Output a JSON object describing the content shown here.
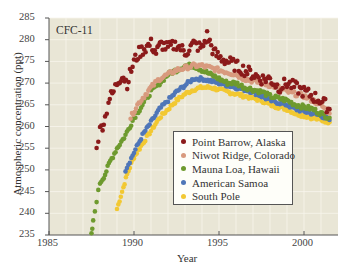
{
  "chart_data": {
    "type": "scatter",
    "title": "CFC-11",
    "xlabel": "Year",
    "ylabel": "Atmospheric concentration (ppt)",
    "xlim": [
      1985,
      2002
    ],
    "ylim": [
      235,
      285
    ],
    "xticks": [
      1985,
      1990,
      1995,
      2000
    ],
    "yticks": [
      235,
      240,
      245,
      250,
      255,
      260,
      265,
      270,
      275,
      280,
      285
    ],
    "grid": true,
    "legend_position": "lower center-right (inside plot)",
    "series": [
      {
        "name": "Point Barrow, Alaska",
        "color": "#8b1a1a",
        "x": [
          1987.8,
          1988.0,
          1988.3,
          1988.5,
          1988.8,
          1989.0,
          1989.3,
          1989.6,
          1990.0,
          1990.3,
          1990.6,
          1991.0,
          1991.3,
          1991.6,
          1992.0,
          1992.5,
          1993.0,
          1993.5,
          1994.0,
          1994.3,
          1994.7,
          1995.0,
          1995.5,
          1996.0,
          1996.5,
          1997.0,
          1997.5,
          1998.0,
          1998.5,
          1999.0,
          1999.5,
          2000.0,
          2000.5,
          2001.0,
          2001.5
        ],
        "values": [
          256,
          259,
          262,
          266,
          268,
          270,
          272,
          270,
          275,
          277,
          278,
          279,
          277,
          279,
          278,
          279,
          277,
          279,
          278,
          281,
          277,
          276,
          275,
          274,
          273,
          272,
          271,
          271,
          269,
          270,
          269,
          268,
          267,
          266,
          264
        ]
      },
      {
        "name": "Niwot Ridge, Colorado",
        "color": "#d89a7e",
        "x": [
          1989.8,
          1990.2,
          1990.6,
          1991.0,
          1991.5,
          1992.0,
          1992.5,
          1993.0,
          1993.5,
          1994.0,
          1994.5,
          1995.0,
          1995.5,
          1996.0,
          1996.5,
          1997.0,
          1997.5,
          1998.0,
          1998.5,
          1999.0,
          1999.5,
          2000.0,
          2000.5,
          2001.0,
          2001.5
        ],
        "values": [
          262,
          265,
          267,
          269,
          271,
          272,
          273,
          273.5,
          274,
          274,
          273.5,
          273,
          272.5,
          272,
          271,
          270.5,
          270,
          269.5,
          269,
          268,
          267.5,
          267,
          266,
          265,
          263
        ]
      },
      {
        "name": "Mauna Loa, Hawaii",
        "color": "#6e9a2e",
        "x": [
          1987.5,
          1987.6,
          1987.8,
          1988.0,
          1988.3,
          1988.6,
          1989.0,
          1989.5,
          1990.0,
          1990.5,
          1991.0,
          1991.5,
          1992.0,
          1992.5,
          1993.0,
          1993.5,
          1994.0,
          1994.5,
          1995.0,
          1995.5,
          1996.0,
          1996.5,
          1997.0,
          1997.5,
          1998.0,
          1998.5,
          1999.0,
          1999.5,
          2000.0,
          2000.5,
          2001.0,
          2001.5
        ],
        "values": [
          235,
          238,
          243,
          247,
          249,
          252,
          255,
          258,
          262,
          265,
          268,
          270,
          272,
          273,
          274,
          274,
          273,
          272,
          271,
          270,
          270,
          269,
          268.5,
          268,
          267,
          266.5,
          266,
          265,
          264.5,
          264,
          263,
          262
        ]
      },
      {
        "name": "American Samoa",
        "color": "#4f76b8",
        "x": [
          1989.5,
          1990.0,
          1990.5,
          1991.0,
          1991.5,
          1992.0,
          1992.5,
          1993.0,
          1993.5,
          1994.0,
          1994.5,
          1995.0,
          1995.5,
          1996.0,
          1996.5,
          1997.0,
          1997.5,
          1998.0,
          1998.5,
          1999.0,
          1999.5,
          2000.0,
          2000.5,
          2001.0,
          2001.5
        ],
        "values": [
          250,
          254,
          258,
          261,
          264,
          266,
          268,
          269.5,
          271,
          271,
          270.5,
          270,
          269.5,
          269,
          268.5,
          268,
          267,
          266,
          265.5,
          265,
          264,
          263.5,
          263,
          262.5,
          261.5
        ]
      },
      {
        "name": "South Pole",
        "color": "#f2c832",
        "x": [
          1989.0,
          1989.3,
          1989.6,
          1990.0,
          1990.5,
          1991.0,
          1991.5,
          1992.0,
          1992.5,
          1993.0,
          1993.5,
          1994.0,
          1994.5,
          1995.0,
          1995.5,
          1996.0,
          1996.5,
          1997.0,
          1997.5,
          1998.0,
          1998.5,
          1999.0,
          1999.5,
          2000.0,
          2000.5,
          2001.0,
          2001.5
        ],
        "values": [
          241,
          245,
          249,
          253,
          256,
          259,
          262,
          264,
          266,
          267.5,
          268.5,
          269,
          269,
          268.5,
          268,
          267.5,
          267,
          266.5,
          266,
          265,
          264.5,
          264,
          263,
          262.5,
          262,
          261.5,
          261
        ]
      }
    ]
  },
  "labels": {
    "title": "CFC-11",
    "xlabel": "Year",
    "ylabel": "Atmospheric concentration (ppt)"
  },
  "legend": [
    {
      "label": "Point Barrow, Alaska",
      "color": "#8b1a1a"
    },
    {
      "label": "Niwot Ridge, Colorado",
      "color": "#d89a7e"
    },
    {
      "label": "Mauna Loa, Hawaii",
      "color": "#6e9a2e"
    },
    {
      "label": "American Samoa",
      "color": "#4f76b8"
    },
    {
      "label": "South Pole",
      "color": "#f2c832"
    }
  ],
  "style": {
    "plot_background": "#e9e6d6",
    "grid_color": "#f7f5ec",
    "axis_color": "#555555"
  }
}
